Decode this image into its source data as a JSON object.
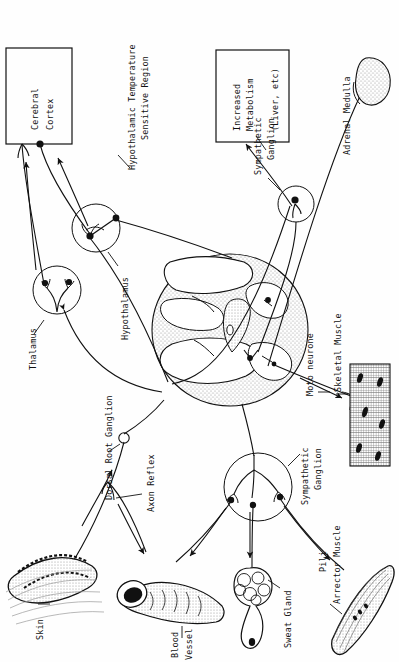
{
  "figure": {
    "domain_note": "anatomical diagram, all text rotated 90 degrees counter-clockwise",
    "orientation": "text-rotated-90-ccw",
    "background_color": "#ffffff",
    "ink_color": "#111111",
    "stipple_color": "#9a9a9a"
  },
  "boxes": [
    {
      "name": "cerebral-cortex-box",
      "lines": [
        "Cerebral",
        "Cortex"
      ]
    },
    {
      "name": "increased-metabolism-box",
      "lines": [
        "Increased",
        "Metabolism",
        "(Liver, etc)"
      ]
    }
  ],
  "labels": {
    "cerebral_cortex_l1": "Cerebral",
    "cerebral_cortex_l2": "Cortex",
    "increased_metabolism_l1": "Increased",
    "increased_metabolism_l2": "Metabolism",
    "increased_metabolism_l3": "(Liver, etc)",
    "hypothalamic_temp_l1": "Hypothalamic Temperature",
    "hypothalamic_temp_l2": "Sensitive Region",
    "sympathetic_ganglion_top_l1": "Sympathetic",
    "sympathetic_ganglion_top_l2": "Ganglion",
    "adrenal_medulla": "Adrenal Medulla",
    "thalamus": "Thalamus",
    "hypothalamus": "Hypothalamus",
    "dorsal_root_ganglion": "Dorsal Root Ganglion",
    "axon_reflex": "Axon Reflex",
    "moto_neurone": "Moto neurone",
    "skeletal_muscle": "Skeletal Muscle",
    "sympathetic_ganglion_bottom_l1": "Sympathetic",
    "sympathetic_ganglion_bottom_l2": "Ganglion",
    "skin": "Skin",
    "blood_vessel_l1": "Blood",
    "blood_vessel_l2": "Vessel",
    "sweat_gland": "Sweat Gland",
    "pili_l1": "Pili",
    "pili_l2": "Arrector Muscle"
  },
  "structures": [
    {
      "name": "spinal-cord-cross-section",
      "type": "organ"
    },
    {
      "name": "thalamus-nucleus",
      "type": "circle-node"
    },
    {
      "name": "hypothalamus-nucleus",
      "type": "circle-node"
    },
    {
      "name": "sympathetic-ganglion-upper",
      "type": "circle-node"
    },
    {
      "name": "sympathetic-ganglion-lower",
      "type": "circle-node"
    },
    {
      "name": "adrenal-medulla-gland",
      "type": "organ"
    },
    {
      "name": "skeletal-muscle-fiber",
      "type": "tissue"
    },
    {
      "name": "skin-section",
      "type": "tissue"
    },
    {
      "name": "blood-vessel",
      "type": "organ"
    },
    {
      "name": "sweat-gland",
      "type": "organ"
    },
    {
      "name": "pili-arrector-muscle",
      "type": "organ"
    },
    {
      "name": "dorsal-root-ganglion-node",
      "type": "small-circle"
    }
  ]
}
